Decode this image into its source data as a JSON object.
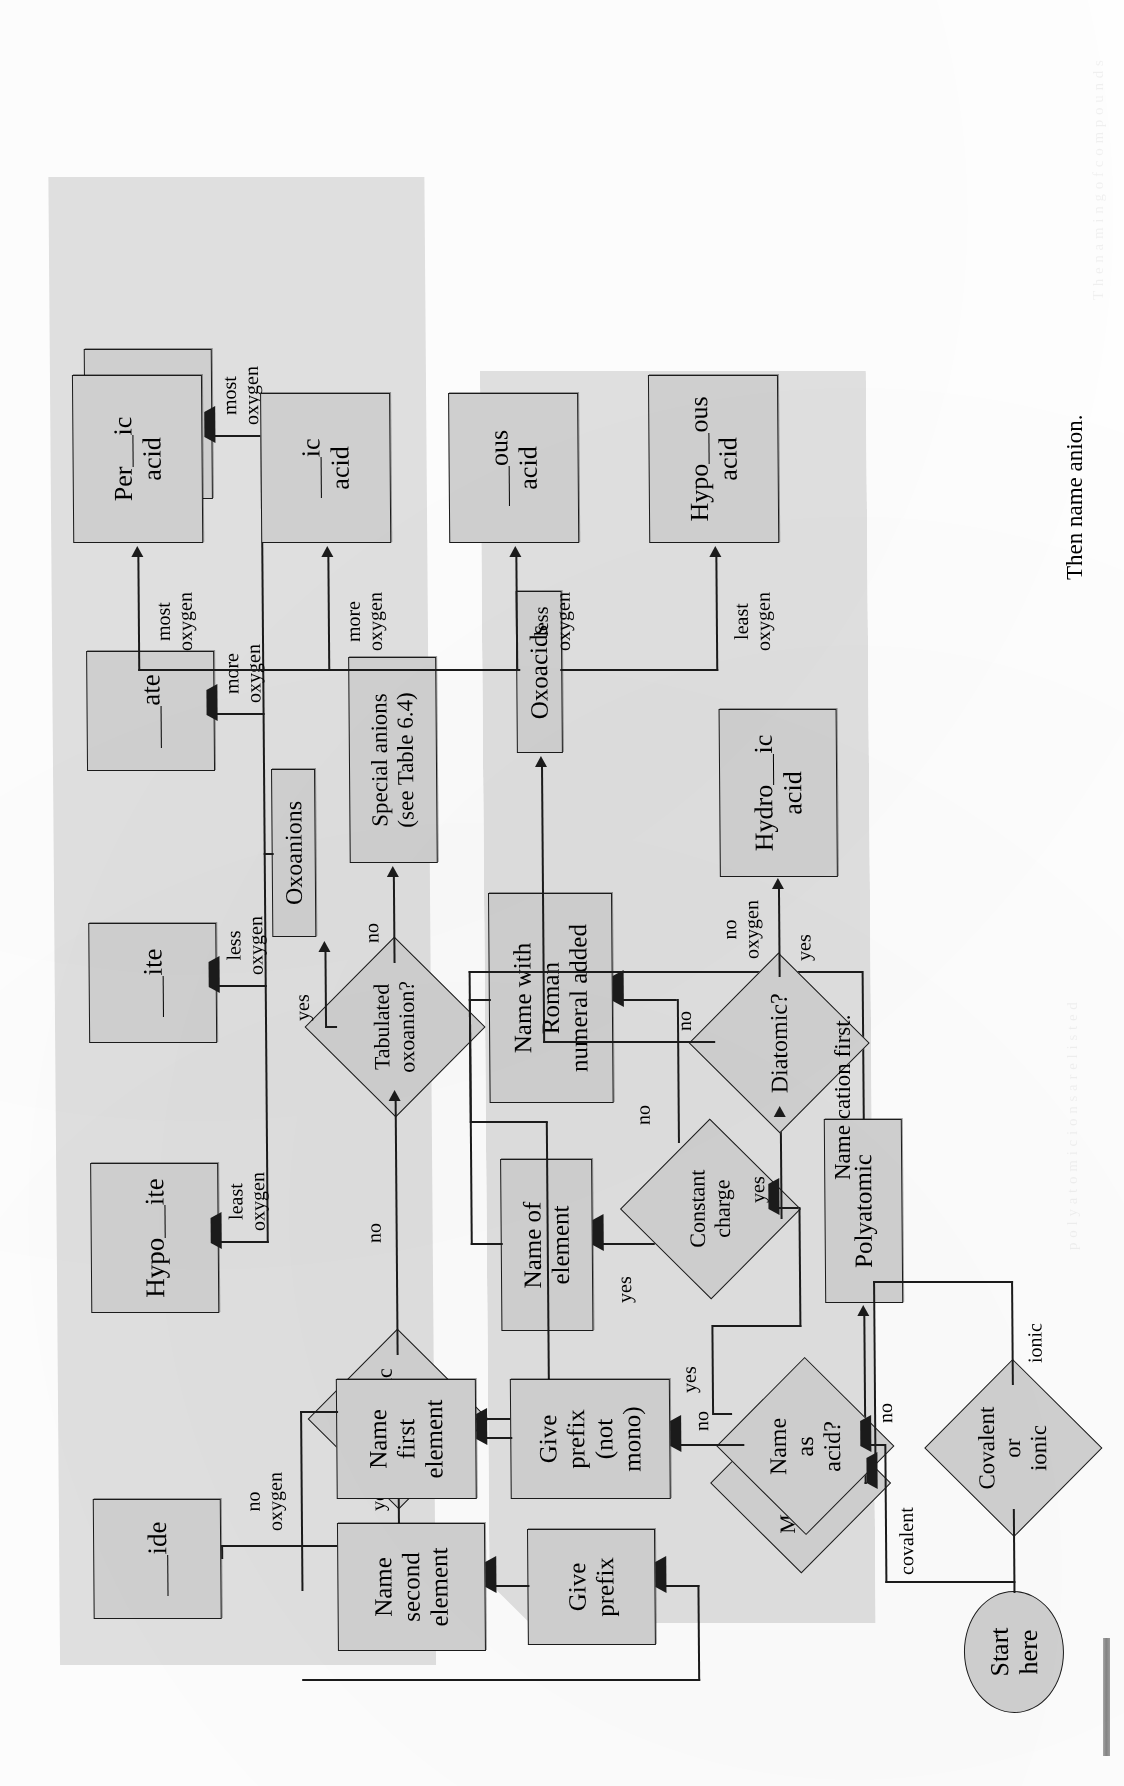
{
  "figure": {
    "captions": {
      "cation": "Name cation first.",
      "anion": "Then name anion."
    }
  },
  "nodes": {
    "start": "Start\nhere",
    "covalent_or_ionic": "Covalent\nor\nionic",
    "name_as_acid": "Name\nas\nacid?",
    "give_prefix_not_mono": "Give\nprefix\n(not\nmono)",
    "name_first_element": "Name\nfirst\nelement",
    "give_prefix": "Give\nprefix",
    "name_second_element": "Name\nsecond\nelement",
    "diatomic": "Diatomic?",
    "hydro_ic_acid": "Hydro__ic\nacid",
    "oxoacids": "Oxoacids",
    "hypo_ous_acid": "Hypo__ous\nacid",
    "ous_acid": "__ous\nacid",
    "ic_acid": "__ic\nacid",
    "per_ic_acid": "Per__ic\nacid",
    "monatomic_cation": "Monatomic\ncation?",
    "constant_charge": "Constant\ncharge",
    "name_of_element": "Name of\nelement",
    "name_with_roman": "Name with\nRoman\nnumeral added",
    "polyatomic": "Polyatomic",
    "monatomic_anion": "Monatomic\nanion?",
    "tabulated_oxoanion": "Tabulated\noxoanion?",
    "special_anions": "Special anions\n(see Table 6.4)",
    "ide": "__ide",
    "oxoanions": "Oxoanions",
    "hypo_ite": "Hypo__ite",
    "ite": "__ite",
    "ate": "__ate",
    "per_ate": "Per__ate"
  },
  "edge_labels": {
    "covalent": "covalent",
    "ionic": "ionic",
    "acid_yes": "yes",
    "acid_no": "no",
    "diatomic_yes": "yes",
    "diatomic_no": "no",
    "no_oxygen_acid": "no\noxygen",
    "least_oxygen_acid": "least\noxygen",
    "less_oxygen_acid": "less\noxygen",
    "more_oxygen_acid": "more\noxygen",
    "most_oxygen_acid": "most\noxygen",
    "mono_cation_yes": "yes",
    "mono_cation_no": "no",
    "const_charge_yes": "yes",
    "const_charge_no": "no",
    "mono_anion_yes": "yes",
    "mono_anion_no": "no",
    "no_oxygen_anion": "no\noxygen",
    "tab_oxo_yes": "yes",
    "tab_oxo_no": "no",
    "least_oxygen_anion": "least\noxygen",
    "less_oxygen_anion": "less\noxygen",
    "more_oxygen_anion": "more\noxygen",
    "most_oxygen_anion": "most\noxygen"
  },
  "colors": {
    "node_fill": "#d2d2d2",
    "band_fill": "#e2e2e2",
    "stroke": "#1b1b1b",
    "page": "#ffffff"
  }
}
